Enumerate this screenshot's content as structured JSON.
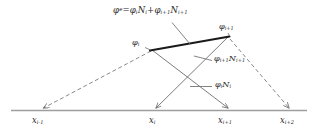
{
  "figure": {
    "type": "diagram",
    "background_color": "#ffffff",
    "line_color": "#6e6e6e",
    "emphasis_color": "#1a1a1a",
    "axis_color": "#9a9a9a"
  },
  "labels": {
    "equation": {
      "phi_sup": "e",
      "text": "= N + N",
      "full": "φᵉ = φᵢNᵢ + φᵢ₊₁Nᵢ₊₁",
      "phi_sym": "φ",
      "eq_sign": "=",
      "plus_sign": "+",
      "sub_i": "i",
      "sub_i_plus_1": "i+1",
      "N_sym": "N"
    },
    "phi_i": {
      "sym": "φ",
      "sub": "i"
    },
    "phi_i_plus_1": {
      "sym": "φ",
      "sub": "i+1"
    },
    "phi_i_plus_1_N_i_plus_1": {
      "phi": "φ",
      "phi_sub": "i+1",
      "N": "N",
      "N_sub": "i+1"
    },
    "phi_i_N_i": {
      "phi": "φ",
      "phi_sub": "i",
      "N": "N",
      "N_sub": "i"
    }
  },
  "axis": {
    "ticks": [
      {
        "name": "x-im1",
        "sym": "x",
        "sub": "i-1"
      },
      {
        "name": "x-i",
        "sym": "x",
        "sub": "i"
      },
      {
        "name": "x-ip1",
        "sym": "x",
        "sub": "i+1"
      },
      {
        "name": "x-ip2",
        "sym": "x",
        "sub": "i+2"
      }
    ]
  }
}
